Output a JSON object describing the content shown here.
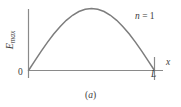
{
  "figure": {
    "caption_open": "(",
    "caption_letter": "a",
    "caption_close": ")",
    "background_color": "#ffffff"
  },
  "axes": {
    "y_axis_label_main": "E",
    "y_axis_label_sub": "max",
    "x_axis_label": "x",
    "origin_label": "0",
    "x_end_tick_label": "L",
    "axis_color": "#8a8a8a",
    "label_color": "#3d3d3d"
  },
  "annotations": {
    "mode_symbol": "n",
    "mode_equals": " = ",
    "mode_value": "1"
  },
  "chart_data": {
    "type": "line",
    "title": "",
    "subtitle": "",
    "xlabel": "x",
    "ylabel": "E_max",
    "grid": false,
    "legend_position": "none",
    "annotations": [
      "n = 1"
    ],
    "xlim": [
      0,
      1
    ],
    "ylim": [
      0,
      1
    ],
    "xticks": [
      0,
      1
    ],
    "xticklabels": [
      "0",
      "L"
    ],
    "yticks": [
      1
    ],
    "yticklabels": [
      "E_max"
    ],
    "curve_color": "#7d7d7d",
    "series": [
      {
        "name": "n = 1 standing wave envelope",
        "equation": "E(x) = E_max * sin(pi * x / L)",
        "x": [
          0,
          0.05,
          0.1,
          0.15,
          0.2,
          0.25,
          0.3,
          0.35,
          0.4,
          0.45,
          0.5,
          0.55,
          0.6,
          0.65,
          0.7,
          0.75,
          0.8,
          0.85,
          0.9,
          0.95,
          1
        ],
        "values": [
          0,
          0.156,
          0.309,
          0.454,
          0.588,
          0.707,
          0.809,
          0.891,
          0.951,
          0.988,
          1,
          0.988,
          0.951,
          0.891,
          0.809,
          0.707,
          0.588,
          0.454,
          0.309,
          0.156,
          0
        ]
      }
    ]
  }
}
